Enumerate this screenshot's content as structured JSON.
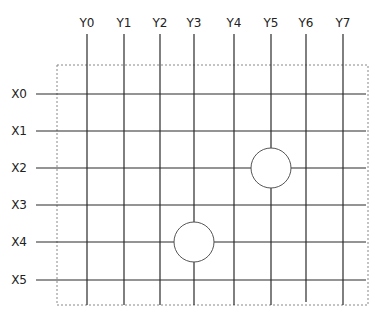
{
  "diagram": {
    "type": "crossbar-grid",
    "columns": [
      {
        "label": "Y0",
        "x": 87
      },
      {
        "label": "Y1",
        "x": 124
      },
      {
        "label": "Y2",
        "x": 160
      },
      {
        "label": "Y3",
        "x": 194
      },
      {
        "label": "Y4",
        "x": 234
      },
      {
        "label": "Y5",
        "x": 271
      },
      {
        "label": "Y6",
        "x": 306
      },
      {
        "label": "Y7",
        "x": 343
      }
    ],
    "rows": [
      {
        "label": "X0",
        "y": 94
      },
      {
        "label": "X1",
        "y": 131
      },
      {
        "label": "X2",
        "y": 168
      },
      {
        "label": "X3",
        "y": 205
      },
      {
        "label": "X4",
        "y": 242
      },
      {
        "label": "X5",
        "y": 280
      }
    ],
    "nodes": [
      {
        "row": "X2",
        "column": "Y5",
        "cx": 271,
        "cy": 168,
        "r": 20
      },
      {
        "row": "X4",
        "column": "Y3",
        "cx": 194,
        "cy": 242,
        "r": 20
      }
    ],
    "boundary": {
      "style": "dashed",
      "x": 57,
      "y": 65,
      "width": 311,
      "height": 240
    },
    "colors": {
      "line": "#2a2a2a",
      "boundary": "#888888",
      "node_stroke": "#555555"
    }
  }
}
